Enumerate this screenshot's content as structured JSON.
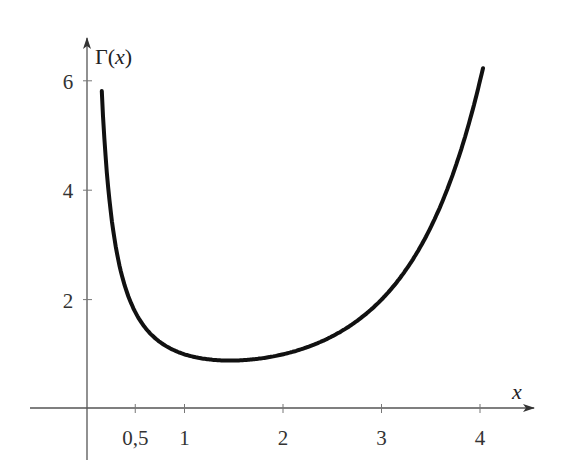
{
  "chart_data": {
    "type": "line",
    "title": "",
    "function": "Gamma function",
    "xlabel": "x",
    "ylabel": "Γ(x)",
    "ylabel_parts": {
      "gamma": "Γ",
      "open": "(",
      "var": "x",
      "close": ")"
    },
    "x_ticks": [
      {
        "value": 0.5,
        "label": "0,5"
      },
      {
        "value": 1,
        "label": "1"
      },
      {
        "value": 2,
        "label": "2"
      },
      {
        "value": 3,
        "label": "3"
      },
      {
        "value": 4,
        "label": "4"
      }
    ],
    "y_ticks": [
      {
        "value": 2,
        "label": "2"
      },
      {
        "value": 4,
        "label": "4"
      },
      {
        "value": 6,
        "label": "6"
      }
    ],
    "x_range": [
      0.15,
      4.05
    ],
    "y_range": [
      0,
      6.4
    ],
    "grid": false,
    "legend": "none",
    "series": [
      {
        "name": "Γ(x)",
        "x": [
          0.16,
          0.2,
          0.25,
          0.3,
          0.4,
          0.5,
          0.6,
          0.8,
          1.0,
          1.2,
          1.4616,
          1.6,
          1.8,
          2.0,
          2.2,
          2.5,
          2.8,
          3.0,
          3.2,
          3.5,
          3.8,
          4.0,
          4.03
        ],
        "values": [
          5.7,
          4.59,
          3.63,
          2.99,
          2.22,
          1.77,
          1.49,
          1.16,
          1.0,
          0.92,
          0.886,
          0.89,
          0.93,
          1.0,
          1.1,
          1.33,
          1.68,
          2.0,
          2.42,
          3.32,
          4.69,
          6.0,
          6.23
        ]
      }
    ],
    "color": "#111111"
  }
}
